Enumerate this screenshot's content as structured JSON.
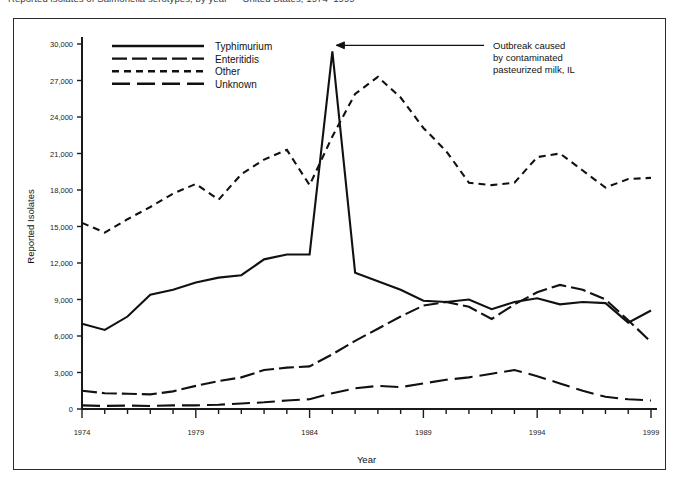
{
  "page": {
    "cutoff_title": "Reported isolates of Salmonella serotypes, by year — United States, 1974–1999"
  },
  "figure": {
    "frame_color": "#2b2b2b",
    "ink_color": "#111111"
  },
  "legend": {
    "entries": [
      {
        "label": "Typhimurium",
        "style": "solid",
        "dasharray": ""
      },
      {
        "label": "Enteritidis",
        "style": "long-dash",
        "dasharray": "15 5"
      },
      {
        "label": "Other",
        "style": "short-dash",
        "dasharray": "7 5"
      },
      {
        "label": "Unknown",
        "style": "medium-dash",
        "dasharray": "18 7"
      }
    ]
  },
  "annotation": {
    "lines": [
      "Outbreak caused",
      "by contaminated",
      "pasteurized milk, IL"
    ],
    "points_to_year": 1985,
    "points_to_value": 29400
  },
  "chart_data": {
    "type": "line",
    "title": "",
    "xlabel": "Year",
    "ylabel": "Reported Isolates",
    "xlim": [
      1974,
      1999
    ],
    "ylim": [
      0,
      30000
    ],
    "ytick_labels": [
      "0",
      "3,000",
      "6,000",
      "9,000",
      "12,000",
      "15,000",
      "18,000",
      "21,000",
      "24,000",
      "27,000",
      "30,000"
    ],
    "yticks": [
      0,
      3000,
      6000,
      9000,
      12000,
      15000,
      18000,
      21000,
      24000,
      27000,
      30000
    ],
    "xtick_labels": [
      "1974",
      "1979",
      "1984",
      "1989",
      "1994",
      "1999"
    ],
    "xticks_major": [
      1974,
      1979,
      1984,
      1989,
      1994,
      1999
    ],
    "xticks_minor_step": 1,
    "grid": false,
    "legend_position": "upper-left",
    "x": [
      1974,
      1975,
      1976,
      1977,
      1978,
      1979,
      1980,
      1981,
      1982,
      1983,
      1984,
      1985,
      1986,
      1987,
      1988,
      1989,
      1990,
      1991,
      1992,
      1993,
      1994,
      1995,
      1996,
      1997,
      1998,
      1999
    ],
    "series": [
      {
        "name": "Typhimurium",
        "style": "solid",
        "values": [
          7000,
          6500,
          7600,
          9400,
          9800,
          10400,
          10800,
          11000,
          12300,
          12700,
          12700,
          29400,
          11200,
          10500,
          9800,
          8900,
          8800,
          9000,
          8200,
          8800,
          9100,
          8600,
          8800,
          8700,
          7100,
          8100
        ]
      },
      {
        "name": "Enteritidis",
        "style": "long-dash",
        "values": [
          1500,
          1300,
          1250,
          1200,
          1450,
          1900,
          2300,
          2600,
          3200,
          3400,
          3500,
          4500,
          5600,
          6600,
          7600,
          8500,
          8800,
          8400,
          7400,
          8600,
          9600,
          10200,
          9800,
          9000,
          7300,
          5500
        ]
      },
      {
        "name": "Other",
        "style": "short-dash",
        "values": [
          15300,
          14500,
          15600,
          16600,
          17700,
          18500,
          17200,
          19300,
          20500,
          21300,
          18400,
          22400,
          25900,
          27300,
          25600,
          23100,
          21200,
          18600,
          18400,
          18600,
          20700,
          21000,
          19600,
          18200,
          18900,
          19000
        ]
      },
      {
        "name": "Unknown",
        "style": "medium-dash",
        "values": [
          300,
          250,
          280,
          250,
          300,
          300,
          350,
          450,
          550,
          700,
          800,
          1300,
          1700,
          1900,
          1800,
          2100,
          2400,
          2600,
          2900,
          3200,
          2700,
          2100,
          1500,
          1000,
          800,
          700
        ]
      }
    ]
  }
}
